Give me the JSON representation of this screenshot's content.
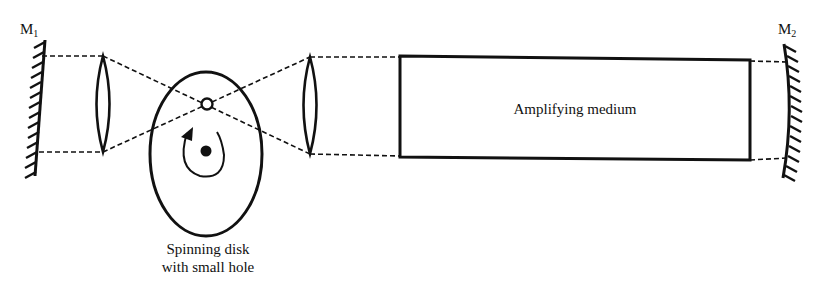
{
  "diagram": {
    "mirror_left": {
      "label": "M",
      "subscript": "1"
    },
    "mirror_right": {
      "label": "M",
      "subscript": "2"
    },
    "disk": {
      "caption_line1": "Spinning disk",
      "caption_line2": "with small hole"
    },
    "medium": {
      "label": "Amplifying medium"
    },
    "components": [
      "mirror-M1",
      "lens-1",
      "spinning-disk",
      "lens-2",
      "amplifying-medium",
      "mirror-M2"
    ],
    "colors": {
      "stroke": "#111111",
      "background": "#ffffff"
    }
  }
}
